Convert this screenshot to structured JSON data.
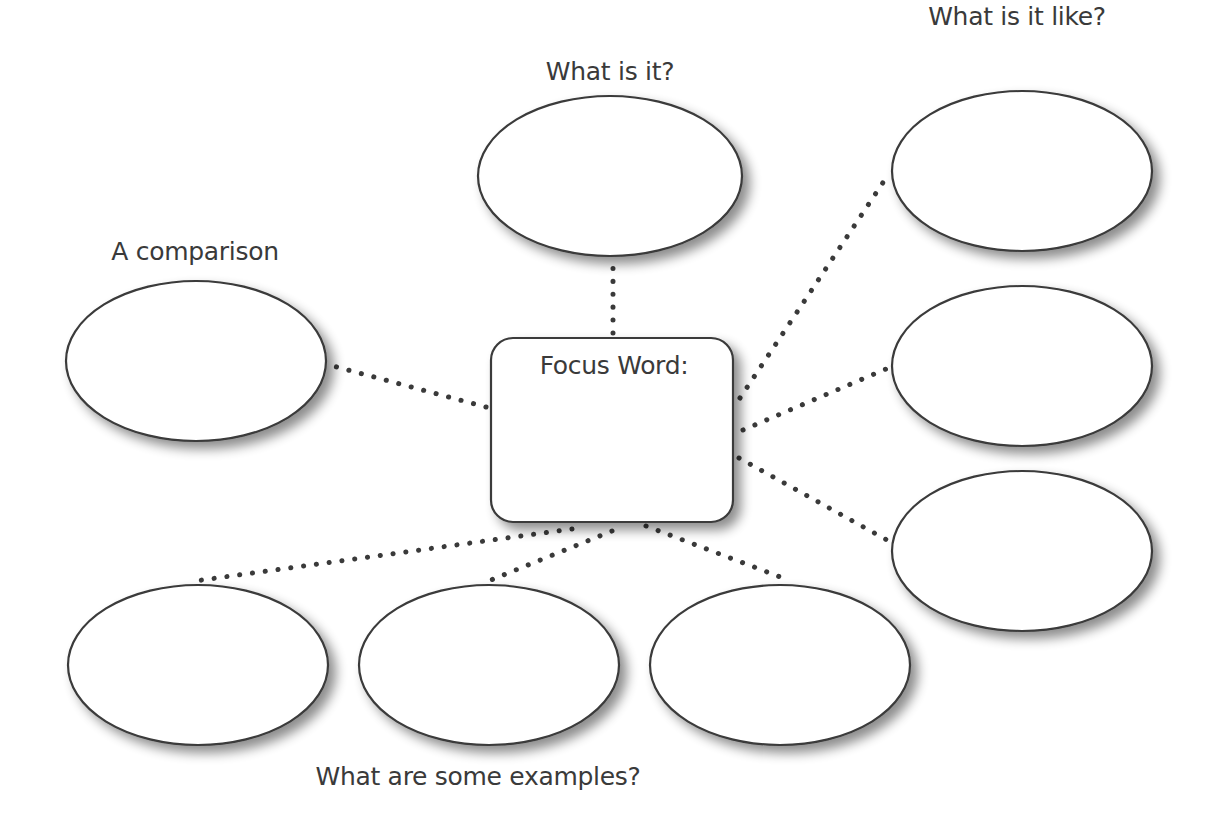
{
  "diagram": {
    "colors": {
      "stroke": "#3a3a3a",
      "fill": "#ffffff",
      "text": "#3a3a3a",
      "shadow": "#9a9a9a"
    },
    "labels": {
      "what_is_it": "What is it?",
      "what_is_it_like": "What is it like?",
      "comparison": "A comparison",
      "focus_word": "Focus Word:",
      "examples": "What are some examples?"
    },
    "focus_box": {
      "x": 491,
      "y": 338,
      "width": 242,
      "height": 184,
      "radius": 22
    },
    "nodes": [
      {
        "id": "what-is-it",
        "cx": 610,
        "cy": 176,
        "rx": 132,
        "ry": 80
      },
      {
        "id": "like-1",
        "cx": 1022,
        "cy": 171,
        "rx": 130,
        "ry": 80
      },
      {
        "id": "like-2",
        "cx": 1022,
        "cy": 366,
        "rx": 130,
        "ry": 80
      },
      {
        "id": "like-3",
        "cx": 1022,
        "cy": 551,
        "rx": 130,
        "ry": 80
      },
      {
        "id": "comparison",
        "cx": 196,
        "cy": 361,
        "rx": 130,
        "ry": 80
      },
      {
        "id": "example-1",
        "cx": 198,
        "cy": 665,
        "rx": 130,
        "ry": 80
      },
      {
        "id": "example-2",
        "cx": 489,
        "cy": 665,
        "rx": 130,
        "ry": 80
      },
      {
        "id": "example-3",
        "cx": 780,
        "cy": 665,
        "rx": 130,
        "ry": 80
      }
    ],
    "connectors": [
      {
        "from": "focus",
        "to": "what-is-it",
        "x1": 613,
        "y1": 333,
        "x2": 613,
        "y2": 263
      },
      {
        "from": "focus",
        "to": "like-1",
        "x1": 740,
        "y1": 398,
        "x2": 886,
        "y2": 178
      },
      {
        "from": "focus",
        "to": "like-2",
        "x1": 743,
        "y1": 430,
        "x2": 886,
        "y2": 369
      },
      {
        "from": "focus",
        "to": "like-3",
        "x1": 739,
        "y1": 458,
        "x2": 887,
        "y2": 540
      },
      {
        "from": "focus",
        "to": "comparison",
        "x1": 486,
        "y1": 407,
        "x2": 333,
        "y2": 366
      },
      {
        "from": "focus",
        "to": "example-1",
        "x1": 572,
        "y1": 529,
        "x2": 195,
        "y2": 581
      },
      {
        "from": "focus",
        "to": "example-2",
        "x1": 612,
        "y1": 531,
        "x2": 491,
        "y2": 580
      },
      {
        "from": "focus",
        "to": "example-3",
        "x1": 646,
        "y1": 526,
        "x2": 783,
        "y2": 578
      }
    ]
  }
}
